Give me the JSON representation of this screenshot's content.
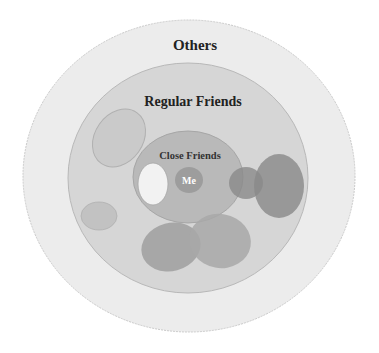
{
  "diagram": {
    "layers": [
      {
        "id": "others",
        "label": "Others",
        "color": "#ececec",
        "stroke": "#c9c9c9"
      },
      {
        "id": "regular_friends",
        "label": "Regular Friends",
        "color": "#d6d6d6",
        "stroke": "#b8b8b8"
      },
      {
        "id": "close_friends",
        "label": "Close Friends",
        "color": "#b9b9b9",
        "stroke": "#a6a6a6"
      },
      {
        "id": "me",
        "label": "Me",
        "color": "#9d9d9d",
        "text_color": "#ffffff"
      }
    ],
    "groups": [
      {
        "name": "group-top-left",
        "color": "#c8c8c8"
      },
      {
        "name": "group-small-left",
        "color": "#c2c2c2"
      },
      {
        "name": "group-white-inner",
        "color": "#f2f2f2"
      },
      {
        "name": "group-right-small",
        "color": "#8a8a8a"
      },
      {
        "name": "group-right-large",
        "color": "#939393"
      },
      {
        "name": "group-bottom-left",
        "color": "#a3a3a3"
      },
      {
        "name": "group-bottom-right",
        "color": "#a8a8a8"
      }
    ],
    "text_color": "#222222"
  }
}
